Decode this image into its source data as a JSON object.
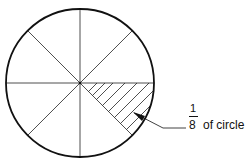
{
  "diagram": {
    "divisions": 8,
    "shaded_sector_index": 1,
    "label": {
      "numerator": "1",
      "denominator": "8",
      "text": "of circle"
    }
  }
}
